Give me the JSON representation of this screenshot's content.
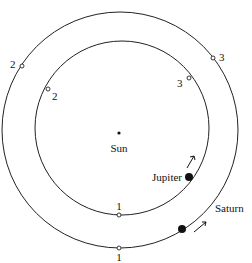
{
  "diagram": {
    "title": "",
    "sun": {
      "label": "Sun",
      "x": 119,
      "y": 133
    },
    "orbits": {
      "jupiter": {
        "cx": 122,
        "cy": 128,
        "r": 87
      },
      "saturn": {
        "cx": 120,
        "cy": 130,
        "r": 118
      }
    },
    "planets": {
      "jupiter": {
        "label": "Jupiter",
        "x": 189,
        "y": 177
      },
      "saturn": {
        "label": "Saturn",
        "x": 182,
        "y": 229
      }
    },
    "jupiter_positions": [
      {
        "label": "1",
        "x": 119,
        "y": 215
      },
      {
        "label": "2",
        "x": 48,
        "y": 89
      },
      {
        "label": "3",
        "x": 189,
        "y": 78
      }
    ],
    "saturn_positions": [
      {
        "label": "1",
        "x": 119,
        "y": 248
      },
      {
        "label": "2",
        "x": 22,
        "y": 66
      },
      {
        "label": "3",
        "x": 213,
        "y": 58
      }
    ],
    "colors": {
      "line": "#222222",
      "background": "#ffffff"
    }
  }
}
